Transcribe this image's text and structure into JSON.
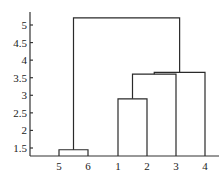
{
  "chart_data": {
    "type": "dendrogram",
    "title": "",
    "xlabel": "",
    "ylabel": "",
    "ylim": [
      1.3,
      5.4
    ],
    "grid": false,
    "yticks": [
      1.5,
      2,
      2.5,
      3,
      3.5,
      4,
      4.5,
      5
    ],
    "ytick_labels": [
      "1.5",
      "2",
      "2.5",
      "3",
      "3.5",
      "4",
      "4.5",
      "5"
    ],
    "leaf_order": [
      "5",
      "6",
      "1",
      "2",
      "3",
      "4"
    ],
    "merges": [
      {
        "left": "5",
        "right": "6",
        "height": 1.45
      },
      {
        "left": "1",
        "right": "2",
        "height": 2.9
      },
      {
        "left": "(1,2)",
        "right": "3",
        "height": 3.6
      },
      {
        "left": "(1,2,3)",
        "right": "4",
        "height": 3.65
      },
      {
        "left": "(5,6)",
        "right": "(1,2,3,4)",
        "height": 5.2
      }
    ]
  }
}
